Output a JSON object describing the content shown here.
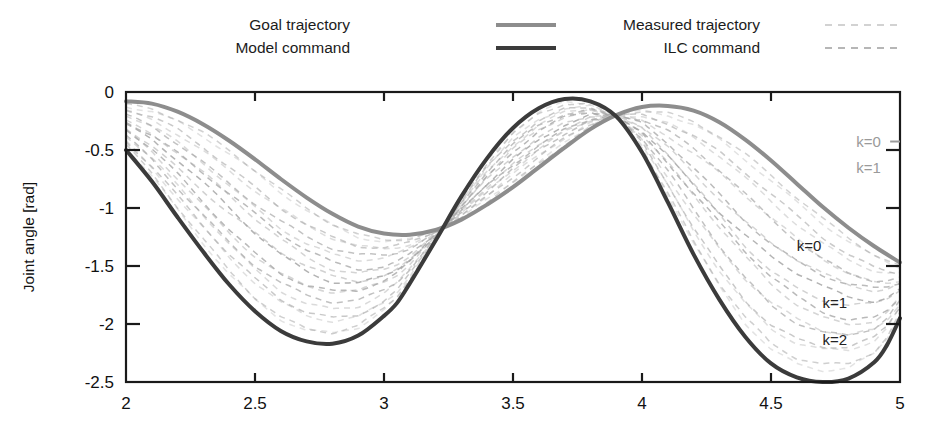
{
  "figure": {
    "background": "#ffffff",
    "frame_color": "#1a1a1a"
  },
  "legend": {
    "position": "top",
    "columns": [
      {
        "entries": [
          {
            "label": "Goal trajectory",
            "style": "solid",
            "color": "#8d8d8d",
            "width": 4.2,
            "name": "goal-trajectory"
          },
          {
            "label": "Model command",
            "style": "solid",
            "color": "#3b3b3b",
            "width": 4.2,
            "name": "model-command"
          }
        ]
      },
      {
        "entries": [
          {
            "label": "Measured trajectory",
            "style": "dashed",
            "color": "#c4c4c4",
            "width": 1.6,
            "name": "measured-trajectory"
          },
          {
            "label": "ILC command",
            "style": "dashed",
            "color": "#9e9e9e",
            "width": 1.6,
            "name": "ilc-command"
          }
        ]
      }
    ]
  },
  "annotations": [
    {
      "text": "k=0",
      "x": 4.83,
      "y": -0.47,
      "color": "#9a9a9a",
      "leader": true,
      "name": "annotation-goal-k0"
    },
    {
      "text": "k=1",
      "x": 4.83,
      "y": -0.7,
      "color": "#9a9a9a",
      "leader": false,
      "name": "annotation-goal-k1"
    },
    {
      "text": "k=0",
      "x": 4.6,
      "y": -1.37,
      "color": "#222222",
      "leader": false,
      "name": "annotation-cmd-k0"
    },
    {
      "text": "k=1",
      "x": 4.7,
      "y": -1.86,
      "color": "#222222",
      "leader": false,
      "name": "annotation-cmd-k1"
    },
    {
      "text": "k=2",
      "x": 4.7,
      "y": -2.18,
      "color": "#222222",
      "leader": false,
      "name": "annotation-cmd-k2"
    }
  ],
  "chart_data": {
    "type": "line",
    "title": "",
    "xlabel": "",
    "ylabel": "Joint angle [rad]",
    "xlim": [
      2,
      5
    ],
    "ylim": [
      -2.5,
      0
    ],
    "xticks": [
      2,
      2.5,
      3,
      3.5,
      4,
      4.5,
      5
    ],
    "xticklabels": [
      "2",
      "2.5",
      "3",
      "3.5",
      "4",
      "4.5",
      "5"
    ],
    "yticks": [
      0,
      -0.5,
      -1,
      -1.5,
      -2,
      -2.5
    ],
    "yticklabels": [
      "0",
      "-0.5",
      "-1",
      "-1.5",
      "-2",
      "-2.5"
    ],
    "grid": false,
    "series": [
      {
        "name": "Goal trajectory",
        "role": "goal",
        "style": "solid",
        "color": "#8d8d8d",
        "width": 4.0,
        "x": [
          2.0,
          2.1,
          2.2,
          2.3,
          2.4,
          2.5,
          2.6,
          2.7,
          2.8,
          2.9,
          3.0,
          3.1,
          3.2,
          3.3,
          3.4,
          3.5,
          3.6,
          3.7,
          3.8,
          3.9,
          4.0,
          4.1,
          4.2,
          4.3,
          4.4,
          4.5,
          4.6,
          4.7,
          4.8,
          4.9,
          5.0
        ],
        "y": [
          -0.08,
          -0.1,
          -0.17,
          -0.28,
          -0.42,
          -0.58,
          -0.75,
          -0.91,
          -1.05,
          -1.16,
          -1.22,
          -1.23,
          -1.19,
          -1.1,
          -0.97,
          -0.82,
          -0.65,
          -0.48,
          -0.32,
          -0.2,
          -0.13,
          -0.12,
          -0.16,
          -0.26,
          -0.41,
          -0.59,
          -0.79,
          -0.99,
          -1.17,
          -1.33,
          -1.47
        ]
      },
      {
        "name": "Model command",
        "role": "command",
        "style": "solid",
        "color": "#3b3b3b",
        "width": 4.0,
        "x": [
          2.0,
          2.1,
          2.2,
          2.3,
          2.4,
          2.5,
          2.6,
          2.7,
          2.8,
          2.9,
          3.0,
          3.05,
          3.1,
          3.2,
          3.3,
          3.4,
          3.5,
          3.6,
          3.7,
          3.8,
          3.9,
          4.0,
          4.1,
          4.2,
          4.3,
          4.4,
          4.5,
          4.6,
          4.7,
          4.8,
          4.9,
          4.95,
          5.0
        ],
        "y": [
          -0.5,
          -0.77,
          -1.08,
          -1.38,
          -1.66,
          -1.89,
          -2.06,
          -2.15,
          -2.17,
          -2.1,
          -1.93,
          -1.82,
          -1.65,
          -1.28,
          -0.9,
          -0.57,
          -0.31,
          -0.14,
          -0.06,
          -0.08,
          -0.21,
          -0.52,
          -0.95,
          -1.4,
          -1.79,
          -2.11,
          -2.34,
          -2.46,
          -2.5,
          -2.47,
          -2.33,
          -2.18,
          -1.95
        ]
      }
    ],
    "iteration_families": [
      {
        "name": "Measured trajectory",
        "role": "measured",
        "style": "dashed",
        "color": "#c8c8c8",
        "width": 1.5,
        "iterations": 9,
        "description": "Dashed light-grey family converging from the model command envelope toward the goal trajectory"
      },
      {
        "name": "ILC command",
        "role": "ilc",
        "style": "dashed",
        "color": "#a5a5a5",
        "width": 1.5,
        "iterations": 9,
        "description": "Dashed grey family converging from the goal trajectory envelope toward the model command"
      }
    ]
  }
}
